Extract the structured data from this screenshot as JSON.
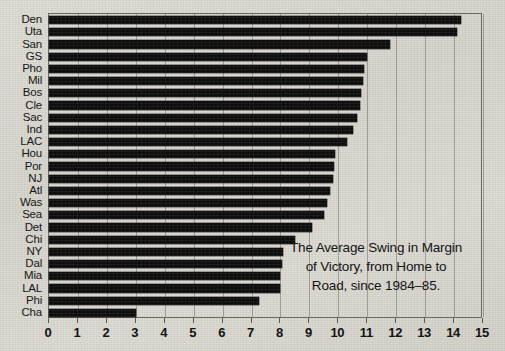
{
  "chart_data": {
    "type": "bar",
    "orientation": "horizontal",
    "title": "",
    "xlabel": "",
    "ylabel": "",
    "xlim": [
      0,
      15
    ],
    "xticks": [
      "0",
      "1",
      "2",
      "3",
      "4",
      "5",
      "6",
      "7",
      "8",
      "9",
      "10",
      "11",
      "12",
      "13",
      "14",
      "15"
    ],
    "grid": true,
    "legend": false,
    "bar_color": "#0d0d0d",
    "categories": [
      "Den",
      "Uta",
      "San",
      "GS",
      "Pho",
      "Mil",
      "Bos",
      "Cle",
      "Sac",
      "Ind",
      "LAC",
      "Hou",
      "Por",
      "NJ",
      "Atl",
      "Was",
      "Sea",
      "Det",
      "Chi",
      "NY",
      "Dal",
      "Mia",
      "LAL",
      "Phi",
      "Cha"
    ],
    "values": [
      14.25,
      14.1,
      11.8,
      11.0,
      10.9,
      10.85,
      10.8,
      10.75,
      10.65,
      10.5,
      10.3,
      9.9,
      9.85,
      9.8,
      9.7,
      9.6,
      9.5,
      9.1,
      8.5,
      8.1,
      8.05,
      8.0,
      8.0,
      7.25,
      3.0
    ],
    "annotations": [
      {
        "name": "caption",
        "line1": "The Average Swing in Margin",
        "line2": "of Victory, from Home to",
        "line3": "Road, since 1984–85."
      }
    ]
  },
  "colors": {
    "paper": "#d9d7d0",
    "ink": "#0d0d0d",
    "frame": "#6d6b66",
    "gridline": "#5a5854"
  }
}
